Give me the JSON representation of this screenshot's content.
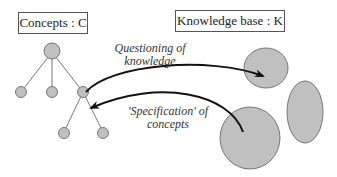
{
  "concepts": {
    "title": "Concepts : C"
  },
  "knowledge_base": {
    "title": "Knowledge base : K"
  },
  "arrows": {
    "questioning": {
      "label_line1": "Questioning of",
      "label_line2": "knowledge"
    },
    "specification": {
      "label_line1": "'Specification' of",
      "label_line2": "concepts"
    }
  },
  "colors": {
    "node_fill": "#c0c0c0",
    "node_stroke": "#777777",
    "arrow": "#111111"
  }
}
